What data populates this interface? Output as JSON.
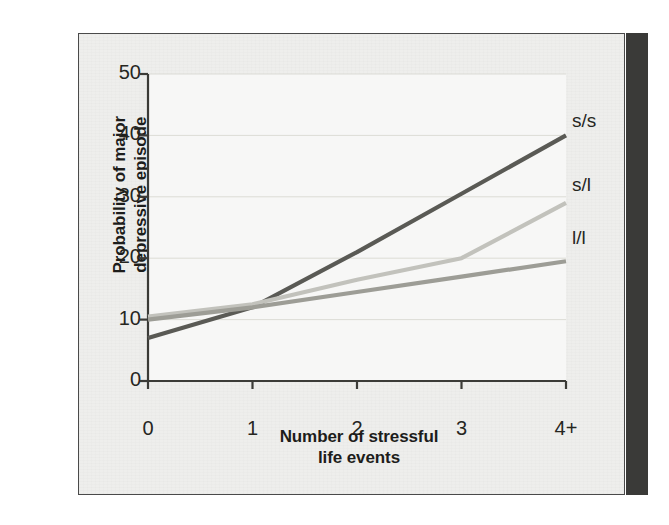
{
  "figure": {
    "panel_background": "#eeeeec",
    "plot_background": "#f7f7f6",
    "border_color": "#4a4a4a",
    "gutter_color": "#3a3a38"
  },
  "chart_data": {
    "type": "line",
    "title": "",
    "xlabel": "Number of stressful life events",
    "ylabel": "Probability of major depressive episode",
    "categories": [
      "0",
      "1",
      "2",
      "3",
      "4+"
    ],
    "x": [
      0,
      1,
      2,
      3,
      4
    ],
    "ylim": [
      0,
      50
    ],
    "xlim": [
      0,
      4
    ],
    "yticks": [
      0,
      10,
      20,
      30,
      40,
      50
    ],
    "ytick_labels": [
      "0",
      "10",
      "20",
      "30",
      "40",
      "50"
    ],
    "xticks": [
      0,
      1,
      2,
      3,
      4
    ],
    "xtick_labels": [
      "0",
      "1",
      "2",
      "3",
      "4+"
    ],
    "grid": "horizontal",
    "grid_color": "#dcdcd6",
    "legend_position": "right-inline-end-of-line",
    "series": [
      {
        "name": "s/s",
        "color": "#5a5a55",
        "width": 4.2,
        "values": [
          7,
          12,
          21,
          30.5,
          40
        ],
        "label_y": 40.5
      },
      {
        "name": "s/l",
        "color": "#c2c2bc",
        "width": 4.2,
        "values": [
          10.5,
          12.5,
          16.5,
          20,
          29
        ],
        "label_y": 30.2
      },
      {
        "name": "l/l",
        "color": "#9d9d96",
        "width": 4.2,
        "values": [
          10,
          12,
          14.5,
          17,
          19.5
        ],
        "label_y": 21.5
      }
    ]
  },
  "axis_titles": {
    "y_line1": "Probability of major",
    "y_line2": "depressive episode",
    "x_line1": "Number of stressful",
    "x_line2": "life events"
  }
}
